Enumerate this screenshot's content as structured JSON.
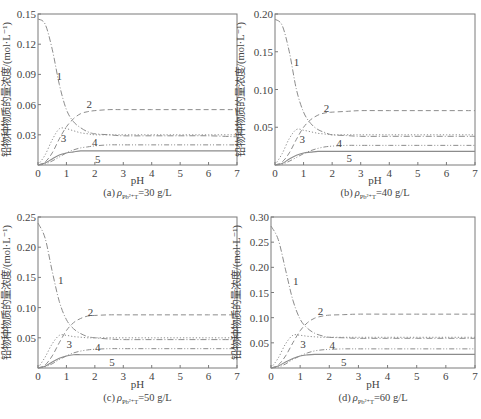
{
  "figure": {
    "ylabel": "铅物种物质的量浓度/(mol·L⁻¹)",
    "xlabel": "pH",
    "curve_labels": [
      "1",
      "2",
      "3",
      "4",
      "5"
    ]
  },
  "chart_data": [
    {
      "type": "line",
      "panel": "a",
      "caption_prefix": "(a)",
      "caption_symbol": "ρ",
      "caption_sub": "Pb²⁺T",
      "caption_value": "=30 g/L",
      "xlabel": "pH",
      "ylabel": "铅物种物质的量浓度/(mol·L⁻¹)",
      "xlim": [
        0,
        7
      ],
      "ylim": [
        0,
        0.15
      ],
      "xticks": [
        "0",
        "1",
        "2",
        "3",
        "4",
        "5",
        "6",
        "7"
      ],
      "yticks": [
        "0.03",
        "0.06",
        "0.09",
        "0.12",
        "0.15"
      ],
      "ytick_values": [
        0.03,
        0.06,
        0.09,
        0.12,
        0.15
      ],
      "grid": false,
      "legend": "inline curve numbers",
      "x": [
        0,
        0.25,
        0.5,
        0.75,
        1.0,
        1.25,
        1.5,
        1.75,
        2.0,
        2.5,
        3,
        4,
        5,
        6,
        7
      ],
      "series": [
        {
          "name": "1",
          "style": "dash-dot",
          "values": [
            0.145,
            0.14,
            0.115,
            0.08,
            0.055,
            0.043,
            0.037,
            0.033,
            0.031,
            0.03,
            0.029,
            0.029,
            0.029,
            0.029,
            0.028
          ]
        },
        {
          "name": "2",
          "style": "dashed",
          "values": [
            0.0,
            0.003,
            0.012,
            0.026,
            0.038,
            0.046,
            0.051,
            0.053,
            0.054,
            0.055,
            0.055,
            0.055,
            0.055,
            0.055,
            0.055
          ]
        },
        {
          "name": "3",
          "style": "dotted",
          "values": [
            0.0,
            0.01,
            0.025,
            0.036,
            0.036,
            0.034,
            0.032,
            0.031,
            0.03,
            0.03,
            0.03,
            0.03,
            0.03,
            0.03,
            0.03
          ]
        },
        {
          "name": "4",
          "style": "dash-dot-dot",
          "values": [
            0.0,
            0.001,
            0.004,
            0.008,
            0.012,
            0.015,
            0.017,
            0.018,
            0.019,
            0.02,
            0.02,
            0.02,
            0.02,
            0.02,
            0.02
          ]
        },
        {
          "name": "5",
          "style": "solid",
          "values": [
            0.0,
            0.002,
            0.006,
            0.01,
            0.012,
            0.013,
            0.014,
            0.014,
            0.014,
            0.014,
            0.014,
            0.014,
            0.014,
            0.014,
            0.014
          ]
        }
      ],
      "label_positions": [
        [
          0.75,
          0.088
        ],
        [
          1.8,
          0.061
        ],
        [
          0.9,
          0.027
        ],
        [
          2.0,
          0.023
        ],
        [
          2.1,
          0.006
        ]
      ]
    },
    {
      "type": "line",
      "panel": "b",
      "caption_prefix": "(b)",
      "caption_symbol": "ρ",
      "caption_sub": "Pb²⁺T",
      "caption_value": "=40 g/L",
      "xlabel": "pH",
      "ylabel": "铅物种物质的量浓度/(mol·L⁻¹)",
      "xlim": [
        0,
        7
      ],
      "ylim": [
        0,
        0.2
      ],
      "xticks": [
        "0",
        "1",
        "2",
        "3",
        "4",
        "5",
        "6",
        "7"
      ],
      "yticks": [
        "0.05",
        "0.10",
        "0.15",
        "0.20"
      ],
      "ytick_values": [
        0.05,
        0.1,
        0.15,
        0.2
      ],
      "grid": false,
      "legend": "inline curve numbers",
      "x": [
        0,
        0.25,
        0.5,
        0.75,
        1.0,
        1.25,
        1.5,
        1.75,
        2.0,
        2.5,
        3,
        4,
        5,
        6,
        7
      ],
      "series": [
        {
          "name": "1",
          "style": "dash-dot",
          "values": [
            0.193,
            0.185,
            0.15,
            0.1,
            0.07,
            0.055,
            0.047,
            0.043,
            0.04,
            0.039,
            0.038,
            0.038,
            0.038,
            0.038,
            0.038
          ]
        },
        {
          "name": "2",
          "style": "dashed",
          "values": [
            0.0,
            0.004,
            0.016,
            0.034,
            0.05,
            0.06,
            0.066,
            0.069,
            0.07,
            0.071,
            0.072,
            0.072,
            0.072,
            0.072,
            0.072
          ]
        },
        {
          "name": "3",
          "style": "dotted",
          "values": [
            0.0,
            0.015,
            0.035,
            0.047,
            0.046,
            0.044,
            0.042,
            0.041,
            0.04,
            0.04,
            0.04,
            0.04,
            0.04,
            0.04,
            0.04
          ]
        },
        {
          "name": "4",
          "style": "dash-dot-dot",
          "values": [
            0.0,
            0.001,
            0.005,
            0.01,
            0.015,
            0.019,
            0.022,
            0.024,
            0.025,
            0.026,
            0.026,
            0.026,
            0.026,
            0.026,
            0.026
          ]
        },
        {
          "name": "5",
          "style": "solid",
          "values": [
            0.0,
            0.002,
            0.008,
            0.013,
            0.016,
            0.017,
            0.018,
            0.018,
            0.018,
            0.018,
            0.018,
            0.018,
            0.018,
            0.018,
            0.018
          ]
        }
      ],
      "label_positions": [
        [
          0.75,
          0.137
        ],
        [
          1.8,
          0.076
        ],
        [
          0.95,
          0.035
        ],
        [
          2.25,
          0.029
        ],
        [
          2.6,
          0.009
        ]
      ]
    },
    {
      "type": "line",
      "panel": "c",
      "caption_prefix": "(c)",
      "caption_symbol": "ρ",
      "caption_sub": "Pb²⁺T",
      "caption_value": "=50 g/L",
      "xlabel": "pH",
      "ylabel": "铅物种物质的量浓度/(mol·L⁻¹)",
      "xlim": [
        0,
        7
      ],
      "ylim": [
        0,
        0.25
      ],
      "xticks": [
        "0",
        "1",
        "2",
        "3",
        "4",
        "5",
        "6",
        "7"
      ],
      "yticks": [
        "0.05",
        "0.10",
        "0.15",
        "0.20",
        "0.25"
      ],
      "ytick_values": [
        0.05,
        0.1,
        0.15,
        0.2,
        0.25
      ],
      "grid": false,
      "legend": "inline curve numbers",
      "x": [
        0,
        0.25,
        0.5,
        0.75,
        1.0,
        1.25,
        1.5,
        1.75,
        2.0,
        2.5,
        3,
        4,
        5,
        6,
        7
      ],
      "series": [
        {
          "name": "1",
          "style": "dash-dot",
          "values": [
            0.24,
            0.215,
            0.16,
            0.11,
            0.08,
            0.065,
            0.057,
            0.052,
            0.05,
            0.048,
            0.047,
            0.047,
            0.047,
            0.047,
            0.047
          ]
        },
        {
          "name": "2",
          "style": "dashed",
          "values": [
            0.0,
            0.005,
            0.02,
            0.042,
            0.062,
            0.075,
            0.082,
            0.086,
            0.087,
            0.088,
            0.088,
            0.088,
            0.088,
            0.088,
            0.088
          ]
        },
        {
          "name": "3",
          "style": "dotted",
          "values": [
            0.0,
            0.018,
            0.04,
            0.054,
            0.054,
            0.052,
            0.051,
            0.05,
            0.05,
            0.05,
            0.05,
            0.05,
            0.05,
            0.05,
            0.05
          ]
        },
        {
          "name": "4",
          "style": "dash-dot-dot",
          "values": [
            0.0,
            0.002,
            0.007,
            0.014,
            0.02,
            0.025,
            0.028,
            0.03,
            0.031,
            0.032,
            0.032,
            0.032,
            0.032,
            0.032,
            0.032
          ]
        },
        {
          "name": "5",
          "style": "solid",
          "values": [
            0.0,
            0.003,
            0.01,
            0.016,
            0.02,
            0.022,
            0.022,
            0.022,
            0.022,
            0.022,
            0.022,
            0.022,
            0.022,
            0.022,
            0.022
          ]
        }
      ],
      "label_positions": [
        [
          0.8,
          0.145
        ],
        [
          1.85,
          0.093
        ],
        [
          1.1,
          0.04
        ],
        [
          2.1,
          0.035
        ],
        [
          2.6,
          0.01
        ]
      ]
    },
    {
      "type": "line",
      "panel": "d",
      "caption_prefix": "(d)",
      "caption_symbol": "ρ",
      "caption_sub": "Pb²⁺T",
      "caption_value": "=60 g/L",
      "xlabel": "pH",
      "ylabel": "铅物种物质的量浓度/(mol·L⁻¹)",
      "xlim": [
        0,
        7
      ],
      "ylim": [
        0,
        0.3
      ],
      "xticks": [
        "0",
        "1",
        "2",
        "3",
        "4",
        "5",
        "6",
        "7"
      ],
      "yticks": [
        "0.05",
        "0.10",
        "0.15",
        "0.20",
        "0.25",
        "0.30"
      ],
      "ytick_values": [
        0.05,
        0.1,
        0.15,
        0.2,
        0.25,
        0.3
      ],
      "grid": false,
      "legend": "inline curve numbers",
      "x": [
        0,
        0.25,
        0.5,
        0.75,
        1.0,
        1.25,
        1.5,
        1.75,
        2.0,
        2.5,
        3,
        4,
        5,
        6,
        7
      ],
      "series": [
        {
          "name": "1",
          "style": "dash-dot",
          "values": [
            0.282,
            0.255,
            0.195,
            0.135,
            0.097,
            0.079,
            0.069,
            0.064,
            0.061,
            0.06,
            0.059,
            0.059,
            0.059,
            0.059,
            0.059
          ]
        },
        {
          "name": "2",
          "style": "dashed",
          "values": [
            0.0,
            0.006,
            0.024,
            0.05,
            0.074,
            0.09,
            0.099,
            0.103,
            0.105,
            0.106,
            0.107,
            0.107,
            0.107,
            0.107,
            0.107
          ]
        },
        {
          "name": "3",
          "style": "dotted",
          "values": [
            0.0,
            0.02,
            0.048,
            0.065,
            0.065,
            0.063,
            0.062,
            0.061,
            0.061,
            0.061,
            0.061,
            0.061,
            0.061,
            0.061,
            0.061
          ]
        },
        {
          "name": "4",
          "style": "dash-dot-dot",
          "values": [
            0.0,
            0.002,
            0.008,
            0.017,
            0.024,
            0.03,
            0.034,
            0.036,
            0.037,
            0.038,
            0.038,
            0.038,
            0.038,
            0.038,
            0.038
          ]
        },
        {
          "name": "5",
          "style": "solid",
          "values": [
            0.0,
            0.004,
            0.012,
            0.019,
            0.024,
            0.026,
            0.027,
            0.027,
            0.027,
            0.027,
            0.027,
            0.027,
            0.027,
            0.027,
            0.027
          ]
        }
      ],
      "label_positions": [
        [
          0.85,
          0.172
        ],
        [
          1.7,
          0.113
        ],
        [
          1.1,
          0.048
        ],
        [
          2.1,
          0.045
        ],
        [
          2.5,
          0.011
        ]
      ]
    }
  ],
  "layout": {
    "panels": [
      {
        "left": 38,
        "top": 14,
        "right": 237,
        "bottom": 165,
        "caption_y": 196,
        "pH_y": 184
      },
      {
        "left": 275,
        "top": 14,
        "right": 475,
        "bottom": 165,
        "caption_y": 196,
        "pH_y": 184
      },
      {
        "left": 38,
        "top": 217,
        "right": 237,
        "bottom": 368,
        "caption_y": 401,
        "pH_y": 388
      },
      {
        "left": 271,
        "top": 217,
        "right": 475,
        "bottom": 368,
        "caption_y": 401,
        "pH_y": 388
      }
    ],
    "colors": {
      "axis": "#7a7a7a",
      "curve": "#8c8c8c",
      "text": "#444444"
    }
  }
}
